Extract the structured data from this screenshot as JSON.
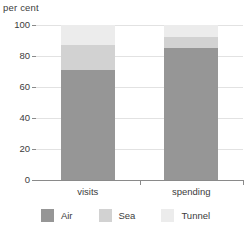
{
  "chart_data": {
    "type": "bar",
    "subtype": "stacked-bar-100",
    "title": "",
    "xlabel": "",
    "ylabel": "per cent",
    "categories": [
      "visits",
      "spending"
    ],
    "series": [
      {
        "name": "Air",
        "color": "#969696",
        "values": [
          71,
          85
        ]
      },
      {
        "name": "Sea",
        "color": "#d2d2d2",
        "values": [
          16,
          7
        ]
      },
      {
        "name": "Tunnel",
        "color": "#ececec",
        "values": [
          13,
          8
        ]
      }
    ],
    "ylim": [
      0,
      100
    ],
    "yticks": [
      0,
      20,
      40,
      60,
      80,
      100
    ],
    "ytick_labels": [
      "0",
      "20",
      "40",
      "60",
      "80",
      "100"
    ],
    "grid": true,
    "grid_axis": "y",
    "legend_position": "bottom",
    "stack_order_bottom_to_top": [
      "Air",
      "Sea",
      "Tunnel"
    ],
    "cumulative_tops": {
      "visits": {
        "Air": 71,
        "Sea": 87,
        "Tunnel": 100
      },
      "spending": {
        "Air": 85,
        "Sea": 92,
        "Tunnel": 100
      }
    }
  },
  "axis": {
    "unit_label": "per cent"
  },
  "legend": {
    "items": [
      {
        "label": "Air",
        "color": "#969696"
      },
      {
        "label": "Sea",
        "color": "#d2d2d2"
      },
      {
        "label": "Tunnel",
        "color": "#ececec"
      }
    ]
  },
  "colors": {
    "background": "#ffffff",
    "gridline": "#e2e2e2",
    "axis": "#8a8a8a",
    "text": "#3c3c3c"
  }
}
